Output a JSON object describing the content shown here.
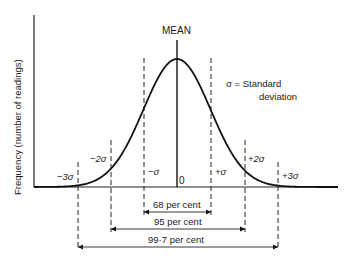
{
  "figure": {
    "y_axis_label": "Frequency (number of readings)",
    "mean_label": "MEAN",
    "zero_label": "0",
    "legend": {
      "line1": "σ = Standard",
      "line2": "deviation"
    },
    "sigma_labels": {
      "m3": "−3σ",
      "m2": "−2σ",
      "m1": "−σ",
      "p1": "+σ",
      "p2": "+2σ",
      "p3": "+3σ"
    },
    "ranges": {
      "one_sigma": "68 per cent",
      "two_sigma": "95 per cent",
      "three_sigma": "99·7 per cent"
    }
  },
  "chart_data": {
    "type": "line",
    "xlabel": "",
    "ylabel": "Frequency (number of readings)",
    "x_ticks": [
      "−3σ",
      "−2σ",
      "−σ",
      "0",
      "+σ",
      "+2σ",
      "+3σ"
    ],
    "annotations": [
      {
        "range": [
          "−σ",
          "+σ"
        ],
        "label": "68 per cent"
      },
      {
        "range": [
          "−2σ",
          "+2σ"
        ],
        "label": "95 per cent"
      },
      {
        "range": [
          "−3σ",
          "+3σ"
        ],
        "label": "99·7 per cent"
      }
    ],
    "grid": false
  }
}
